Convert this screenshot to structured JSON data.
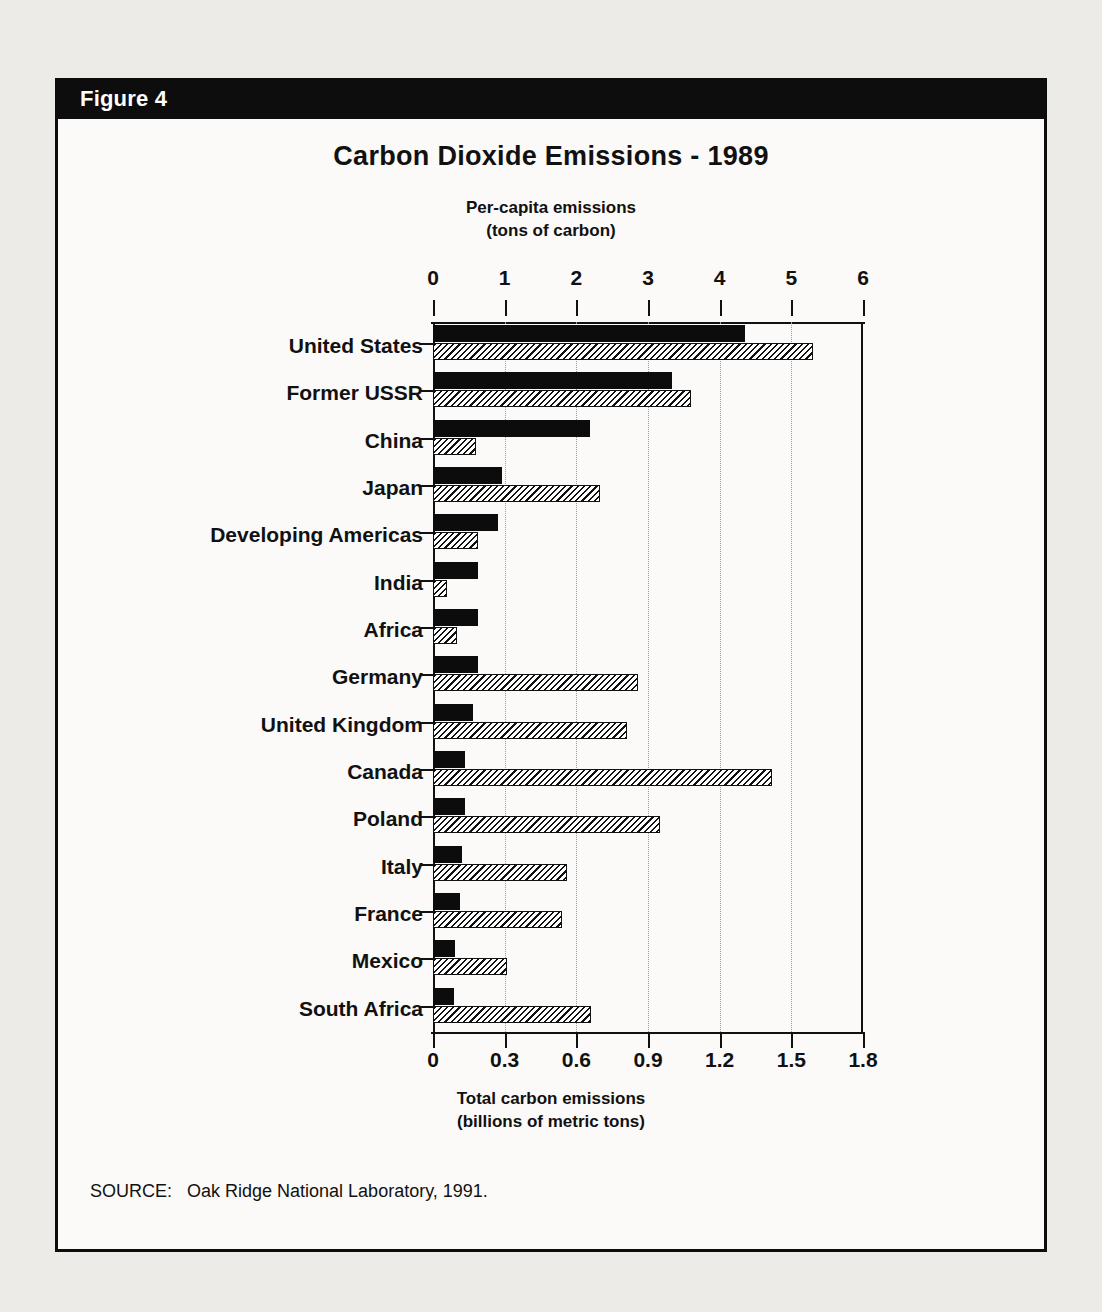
{
  "figure": {
    "label": "Figure 4",
    "title": "Carbon Dioxide Emissions - 1989",
    "source": "SOURCE:   Oak Ridge National Laboratory, 1991."
  },
  "chart_data": {
    "type": "bar",
    "orientation": "horizontal",
    "title": "Carbon Dioxide Emissions - 1989",
    "top_axis_label_line1": "Per-capita emissions",
    "top_axis_label_line2": "(tons of carbon)",
    "bottom_axis_label_line1": "Total carbon emissions",
    "bottom_axis_label_line2": "(billions of metric tons)",
    "grid": true,
    "legend": null,
    "top_axis": {
      "name": "Per-capita emissions (tons of carbon)",
      "ticks": [
        "0",
        "1",
        "2",
        "3",
        "4",
        "5",
        "6"
      ],
      "min": 0,
      "max": 6
    },
    "bottom_axis": {
      "name": "Total carbon emissions (billions of metric tons)",
      "ticks": [
        "0",
        "0.3",
        "0.6",
        "0.9",
        "1.2",
        "1.5",
        "1.8"
      ],
      "min": 0,
      "max": 1.8
    },
    "categories": [
      "United States",
      "Former USSR",
      "China",
      "Japan",
      "Developing Americas",
      "India",
      "Africa",
      "Germany",
      "United Kingdom",
      "Canada",
      "Poland",
      "Italy",
      "France",
      "Mexico",
      "South Africa"
    ],
    "series": [
      {
        "name": "Per-capita emissions (tons of carbon)",
        "style": "solid-black",
        "axis": "top",
        "values": [
          4.35,
          3.33,
          2.19,
          0.96,
          0.91,
          0.63,
          0.63,
          0.63,
          0.56,
          0.45,
          0.45,
          0.4,
          0.38,
          0.31,
          0.29
        ]
      },
      {
        "name": "Total carbon emissions (billions of metric tons)",
        "style": "hatched",
        "axis": "bottom",
        "values": [
          1.59,
          1.08,
          0.18,
          0.7,
          0.19,
          0.06,
          0.1,
          0.86,
          0.81,
          1.42,
          0.95,
          0.56,
          0.54,
          0.31,
          0.66
        ]
      }
    ]
  }
}
